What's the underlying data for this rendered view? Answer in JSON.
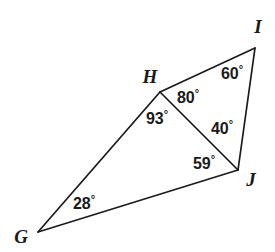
{
  "figure": {
    "kind": "geometry-diagram",
    "background_color": "#ffffff",
    "stroke_color": "#1a1a1a",
    "text_color": "#1a1a1a",
    "width": 275,
    "height": 252
  },
  "vertices": [
    {
      "id": "G",
      "label": "G",
      "point_x": 38,
      "point_y": 232,
      "label_x": 21,
      "label_y": 236
    },
    {
      "id": "H",
      "label": "H",
      "point_x": 160,
      "point_y": 92,
      "label_x": 150,
      "label_y": 76
    },
    {
      "id": "I",
      "label": "I",
      "point_x": 255,
      "point_y": 48,
      "label_x": 258,
      "label_y": 26
    },
    {
      "id": "J",
      "label": "J",
      "point_x": 238,
      "point_y": 170,
      "label_x": 251,
      "label_y": 179
    }
  ],
  "edges": [
    {
      "id": "G-H",
      "from": "G",
      "to": "H"
    },
    {
      "id": "H-I",
      "from": "H",
      "to": "I"
    },
    {
      "id": "I-J",
      "from": "I",
      "to": "J"
    },
    {
      "id": "J-G",
      "from": "J",
      "to": "G"
    },
    {
      "id": "H-J",
      "from": "H",
      "to": "J"
    }
  ],
  "angles": [
    {
      "id": "angle-G",
      "at_vertex": "G",
      "value": "28",
      "degree_symbol": "°",
      "label_x": 84,
      "label_y": 203
    },
    {
      "id": "angle-GHJ",
      "at_vertex": "H",
      "value": "93",
      "degree_symbol": "°",
      "label_x": 157,
      "label_y": 118
    },
    {
      "id": "angle-JHI",
      "at_vertex": "H",
      "value": "80",
      "degree_symbol": "°",
      "label_x": 188,
      "label_y": 97
    },
    {
      "id": "angle-I",
      "at_vertex": "I",
      "value": "60",
      "degree_symbol": "°",
      "label_x": 232,
      "label_y": 73
    },
    {
      "id": "angle-HJI",
      "at_vertex": "J",
      "value": "40",
      "degree_symbol": "°",
      "label_x": 222,
      "label_y": 128
    },
    {
      "id": "angle-GJH",
      "at_vertex": "J",
      "value": "59",
      "degree_symbol": "°",
      "label_x": 204,
      "label_y": 163
    }
  ]
}
